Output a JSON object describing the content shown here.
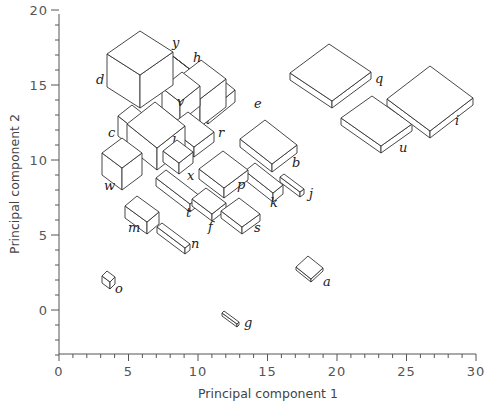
{
  "chart_data": {
    "type": "scatter",
    "subtype": "3d-glyph-scatter (boxes sized by additional variables)",
    "title": "",
    "xlabel": "Principal component 1",
    "ylabel": "Principal component 2",
    "xlim": [
      0,
      30
    ],
    "ylim": [
      -3,
      20
    ],
    "x_ticks": [
      0,
      5,
      10,
      15,
      20,
      25,
      30
    ],
    "y_ticks": [
      0,
      5,
      10,
      15,
      20
    ],
    "x_tick_labels": [
      "0",
      "5",
      "10",
      "15",
      "20",
      "25",
      "30"
    ],
    "y_tick_labels": [
      "0",
      "5",
      "10",
      "15",
      "20"
    ],
    "grid": false,
    "legend": null,
    "points": [
      {
        "label": "a",
        "x": 18.2,
        "y": 2.8
      },
      {
        "label": "b",
        "x": 14.5,
        "y": 10.8
      },
      {
        "label": "c",
        "x": 5.2,
        "y": 12.0
      },
      {
        "label": "d",
        "x": 6.5,
        "y": 15.6
      },
      {
        "label": "e",
        "x": 11.5,
        "y": 14.3
      },
      {
        "label": "f",
        "x": 11.0,
        "y": 6.5
      },
      {
        "label": "g",
        "x": 12.2,
        "y": -0.5
      },
      {
        "label": "h",
        "x": 9.5,
        "y": 16.5
      },
      {
        "label": "i",
        "x": 26.5,
        "y": 14.2
      },
      {
        "label": "j",
        "x": 16.5,
        "y": 7.8
      },
      {
        "label": "k",
        "x": 14.2,
        "y": 7.8
      },
      {
        "label": "l",
        "x": 7.5,
        "y": 12.5
      },
      {
        "label": "m",
        "x": 5.5,
        "y": 6.5
      },
      {
        "label": "n",
        "x": 7.8,
        "y": 4.8
      },
      {
        "label": "o",
        "x": 3.3,
        "y": 2.0
      },
      {
        "label": "p",
        "x": 11.8,
        "y": 9.5
      },
      {
        "label": "q",
        "x": 19.5,
        "y": 15.3
      },
      {
        "label": "r",
        "x": 10.0,
        "y": 11.7
      },
      {
        "label": "s",
        "x": 12.8,
        "y": 5.6
      },
      {
        "label": "t",
        "x": 8.3,
        "y": 7.7
      },
      {
        "label": "u",
        "x": 22.0,
        "y": 11.7
      },
      {
        "label": "v",
        "x": 8.8,
        "y": 14.0
      },
      {
        "label": "w",
        "x": 4.3,
        "y": 10.0
      },
      {
        "label": "x",
        "x": 8.8,
        "y": 10.3
      },
      {
        "label": "y",
        "x": 8.3,
        "y": 17.5
      }
    ]
  },
  "axes": {
    "x_title": "Principal component 1",
    "y_title": "Principal component 2",
    "x_ticks": [
      {
        "value": 0,
        "label": "0"
      },
      {
        "value": 5,
        "label": "5"
      },
      {
        "value": 10,
        "label": "10"
      },
      {
        "value": 15,
        "label": "15"
      },
      {
        "value": 20,
        "label": "20"
      },
      {
        "value": 25,
        "label": "25"
      },
      {
        "value": 30,
        "label": "30"
      }
    ],
    "y_ticks": [
      {
        "value": 0,
        "label": "0"
      },
      {
        "value": 5,
        "label": "5"
      },
      {
        "value": 10,
        "label": "10"
      },
      {
        "value": 15,
        "label": "15"
      },
      {
        "value": 20,
        "label": "20"
      }
    ]
  },
  "glyphs": [
    {
      "label": "e",
      "L": [
        178,
        88
      ],
      "r1": [
        27,
        -22
      ],
      "r2": [
        30,
        24
      ],
      "h": 12,
      "lp": [
        254,
        108
      ]
    },
    {
      "label": "y",
      "L": [
        152,
        40
      ],
      "r1": [
        0,
        0
      ],
      "r2": [
        44,
        34
      ],
      "h": 26,
      "lp": [
        172,
        47
      ]
    },
    {
      "label": "h",
      "L": [
        175,
        80
      ],
      "r1": [
        26,
        -20
      ],
      "r2": [
        25,
        19
      ],
      "h": 28,
      "lp": [
        193,
        62
      ]
    },
    {
      "label": "v",
      "L": [
        162,
        88
      ],
      "r1": [
        20,
        -16
      ],
      "r2": [
        18,
        14
      ],
      "h": 20,
      "lp": [
        177,
        106
      ]
    },
    {
      "label": "r",
      "L": [
        168,
        127
      ],
      "r1": [
        20,
        -15
      ],
      "r2": [
        26,
        20
      ],
      "h": 10,
      "lp": [
        218,
        137
      ]
    },
    {
      "label": "c",
      "L": [
        118,
        116
      ],
      "r1": [
        14,
        -11
      ],
      "r2": [
        24,
        19
      ],
      "h": 20,
      "lp": [
        108,
        137
      ]
    },
    {
      "label": "d",
      "L": [
        107,
        54
      ],
      "r1": [
        33,
        -23
      ],
      "r2": [
        33,
        21
      ],
      "h": 33,
      "lp": [
        96,
        84
      ]
    },
    {
      "label": "l",
      "L": [
        127,
        124
      ],
      "r1": [
        28,
        -22
      ],
      "r2": [
        30,
        24
      ],
      "h": 22,
      "lp": [
        172,
        146
      ]
    },
    {
      "label": "x",
      "L": [
        163,
        151
      ],
      "r1": [
        14,
        -11
      ],
      "r2": [
        16,
        12
      ],
      "h": 11,
      "lp": [
        187,
        180
      ]
    },
    {
      "label": "w",
      "L": [
        102,
        153
      ],
      "r1": [
        20,
        -15
      ],
      "r2": [
        20,
        15
      ],
      "h": 22,
      "lp": [
        104,
        190
      ]
    },
    {
      "label": "b",
      "L": [
        240,
        139
      ],
      "r1": [
        25,
        -19
      ],
      "r2": [
        32,
        25
      ],
      "h": 8,
      "lp": [
        292,
        167
      ]
    },
    {
      "label": "t",
      "L": [
        156,
        178
      ],
      "r1": [
        10,
        -8
      ],
      "r2": [
        34,
        26
      ],
      "h": 8,
      "lp": [
        186,
        217
      ]
    },
    {
      "label": "j",
      "L": [
        280,
        177
      ],
      "r1": [
        4,
        -3
      ],
      "r2": [
        20,
        15
      ],
      "h": 5,
      "lp": [
        309,
        198
      ]
    },
    {
      "label": "k",
      "L": [
        245,
        171
      ],
      "r1": [
        10,
        -8
      ],
      "r2": [
        28,
        22
      ],
      "h": 9,
      "lp": [
        270,
        207
      ]
    },
    {
      "label": "p",
      "L": [
        199,
        169
      ],
      "r1": [
        24,
        -18
      ],
      "r2": [
        25,
        19
      ],
      "h": 10,
      "lp": [
        237,
        189
      ]
    },
    {
      "label": "f",
      "L": [
        192,
        199
      ],
      "r1": [
        14,
        -11
      ],
      "r2": [
        20,
        15
      ],
      "h": 7,
      "lp": [
        208,
        231
      ]
    },
    {
      "label": "s",
      "L": [
        221,
        211
      ],
      "r1": [
        18,
        -13
      ],
      "r2": [
        21,
        16
      ],
      "h": 7,
      "lp": [
        254,
        232
      ]
    },
    {
      "label": "m",
      "L": [
        125,
        206
      ],
      "r1": [
        12,
        -10
      ],
      "r2": [
        22,
        16
      ],
      "h": 12,
      "lp": [
        128,
        232
      ]
    },
    {
      "label": "n",
      "L": [
        157,
        227
      ],
      "r1": [
        5,
        -4
      ],
      "r2": [
        28,
        21
      ],
      "h": 6,
      "lp": [
        191,
        248
      ]
    },
    {
      "label": "o",
      "L": [
        102,
        276
      ],
      "r1": [
        5,
        -5
      ],
      "r2": [
        8,
        6
      ],
      "h": 7,
      "lp": [
        115,
        293
      ]
    },
    {
      "label": "q",
      "L": [
        290,
        73
      ],
      "r1": [
        39,
        -29
      ],
      "r2": [
        42,
        28
      ],
      "h": 7,
      "lp": [
        375,
        83
      ]
    },
    {
      "label": "u",
      "L": [
        341,
        118
      ],
      "r1": [
        31,
        -22
      ],
      "r2": [
        40,
        28
      ],
      "h": 7,
      "lp": [
        399,
        152
      ]
    },
    {
      "label": "i",
      "L": [
        387,
        99
      ],
      "r1": [
        43,
        -33
      ],
      "r2": [
        43,
        32
      ],
      "h": 7,
      "lp": [
        455,
        125
      ]
    },
    {
      "label": "a",
      "L": [
        296,
        267
      ],
      "r1": [
        12,
        -11
      ],
      "r2": [
        15,
        12
      ],
      "h": 3,
      "lp": [
        323,
        286
      ]
    },
    {
      "label": "g",
      "L": [
        222,
        313
      ],
      "r1": [
        2,
        -2
      ],
      "r2": [
        15,
        11
      ],
      "h": 3,
      "lp": [
        244,
        327
      ]
    }
  ],
  "colors": {
    "stroke": "#333333",
    "fill": "#ffffff",
    "axis": "#555555",
    "text": "#444444"
  }
}
